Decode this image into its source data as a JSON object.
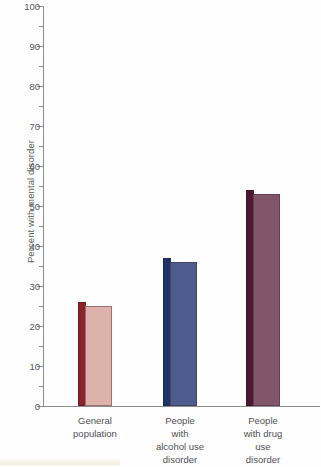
{
  "chart_data": {
    "type": "bar",
    "title": "",
    "xlabel": "",
    "ylabel": "Percent with mental disorder",
    "ylim": [
      0,
      100
    ],
    "ytick_step": 10,
    "yminor_step": 5,
    "grid": false,
    "legend": null,
    "categories": [
      "General population",
      "People with alcohol use disorder",
      "People with drug use disorder"
    ],
    "values": [
      25,
      36,
      53
    ],
    "ytick_labels": [
      "0",
      "10",
      "20",
      "30",
      "40",
      "50",
      "60",
      "70",
      "80",
      "90",
      "100"
    ]
  },
  "axes": {
    "y_title": "Percent with mental disorder",
    "ticks": [
      {
        "value": 100,
        "label": "100"
      },
      {
        "value": 95,
        "label": ""
      },
      {
        "value": 90,
        "label": "90"
      },
      {
        "value": 85,
        "label": ""
      },
      {
        "value": 80,
        "label": "80"
      },
      {
        "value": 75,
        "label": ""
      },
      {
        "value": 70,
        "label": "70"
      },
      {
        "value": 65,
        "label": ""
      },
      {
        "value": 60,
        "label": "60"
      },
      {
        "value": 55,
        "label": ""
      },
      {
        "value": 50,
        "label": "50"
      },
      {
        "value": 45,
        "label": ""
      },
      {
        "value": 40,
        "label": "40"
      },
      {
        "value": 35,
        "label": ""
      },
      {
        "value": 30,
        "label": "30"
      },
      {
        "value": 25,
        "label": ""
      },
      {
        "value": 20,
        "label": "20"
      },
      {
        "value": 15,
        "label": ""
      },
      {
        "value": 10,
        "label": "10"
      },
      {
        "value": 5,
        "label": ""
      },
      {
        "value": 0,
        "label": "0"
      }
    ]
  },
  "bars": [
    {
      "label_lines": [
        "General",
        "population"
      ],
      "value": 25,
      "front_color": "#ddb2ab",
      "side_color": "#8b2327"
    },
    {
      "label_lines": [
        "People",
        "with",
        "alcohol use",
        "disorder"
      ],
      "value": 36,
      "front_color": "#4b5c8d",
      "side_color": "#1f3468"
    },
    {
      "label_lines": [
        "People",
        "with drug",
        "use",
        "disorder"
      ],
      "value": 53,
      "front_color": "#83556b",
      "side_color": "#4b1931"
    }
  ],
  "colors": {
    "axis": "#8d8d8b",
    "text": "#52525a",
    "background": "#fefefe"
  }
}
